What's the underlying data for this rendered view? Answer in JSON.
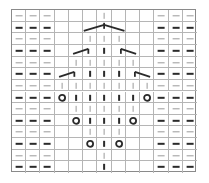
{
  "chart_title": "",
  "grid": {
    "cols": 13,
    "rows": 14,
    "line_color": "#b5b5b5",
    "border_color": "#8a8a8a",
    "ink_color": "#2a2a2a",
    "light_ink_color": "#9a9a9a"
  },
  "legend_symbols": {
    "purl-light": "purl (light)",
    "purl-bold": "purl (bold)",
    "knit-light": "knit (light)",
    "knit-bold": "knit (bold)",
    "yarn-over": "O",
    "left-decrease": "/",
    "right-decrease": "\\",
    "centered-double-decrease": "^"
  },
  "rows": [
    [
      "purl-light",
      "purl-light",
      "purl-light",
      "",
      "",
      "",
      "knit-light",
      "",
      "",
      "",
      "purl-light",
      "purl-light",
      "purl-light"
    ],
    [
      "purl-bold",
      "purl-bold",
      "purl-bold",
      "",
      "",
      "cdd-left",
      "cdd-peak",
      "cdd-right",
      "",
      "",
      "purl-bold",
      "purl-bold",
      "purl-bold"
    ],
    [
      "purl-light",
      "purl-light",
      "purl-light",
      "",
      "",
      "knit-light",
      "knit-light",
      "knit-light",
      "",
      "",
      "purl-light",
      "purl-light",
      "purl-light"
    ],
    [
      "purl-bold",
      "purl-bold",
      "purl-bold",
      "",
      "left-dec",
      "",
      "knit-bold",
      "",
      "right-dec",
      "",
      "purl-bold",
      "purl-bold",
      "purl-bold"
    ],
    [
      "purl-light",
      "purl-light",
      "purl-light",
      "",
      "knit-light",
      "knit-light",
      "knit-light",
      "knit-light",
      "knit-light",
      "",
      "purl-light",
      "purl-light",
      "purl-light"
    ],
    [
      "purl-bold",
      "purl-bold",
      "purl-bold",
      "left-dec",
      "",
      "knit-bold",
      "knit-bold",
      "knit-bold",
      "",
      "right-dec",
      "purl-bold",
      "purl-bold",
      "purl-bold"
    ],
    [
      "purl-light",
      "purl-light",
      "purl-light",
      "knit-light",
      "knit-light",
      "knit-light",
      "knit-light",
      "knit-light",
      "knit-light",
      "knit-light",
      "purl-light",
      "purl-light",
      "purl-light"
    ],
    [
      "purl-bold",
      "purl-bold",
      "purl-bold",
      "yarn-over",
      "knit-bold",
      "knit-bold",
      "knit-bold",
      "knit-bold",
      "knit-bold",
      "yarn-over",
      "purl-bold",
      "purl-bold",
      "purl-bold"
    ],
    [
      "purl-light",
      "purl-light",
      "purl-light",
      "",
      "knit-light",
      "knit-light",
      "knit-light",
      "knit-light",
      "knit-light",
      "",
      "purl-light",
      "purl-light",
      "purl-light"
    ],
    [
      "purl-bold",
      "purl-bold",
      "purl-bold",
      "",
      "yarn-over",
      "knit-bold",
      "knit-bold",
      "knit-bold",
      "yarn-over",
      "",
      "purl-bold",
      "purl-bold",
      "purl-bold"
    ],
    [
      "purl-light",
      "purl-light",
      "purl-light",
      "",
      "",
      "knit-light",
      "knit-light",
      "knit-light",
      "",
      "",
      "purl-light",
      "purl-light",
      "purl-light"
    ],
    [
      "purl-bold",
      "purl-bold",
      "purl-bold",
      "",
      "",
      "yarn-over",
      "knit-bold",
      "yarn-over",
      "",
      "",
      "purl-bold",
      "purl-bold",
      "purl-bold"
    ],
    [
      "purl-light",
      "purl-light",
      "purl-light",
      "",
      "",
      "",
      "knit-light",
      "",
      "",
      "",
      "purl-light",
      "purl-light",
      "purl-light"
    ],
    [
      "purl-bold",
      "purl-bold",
      "purl-bold",
      "",
      "",
      "",
      "knit-bold",
      "",
      "",
      "",
      "purl-bold",
      "purl-bold",
      "purl-bold"
    ]
  ]
}
